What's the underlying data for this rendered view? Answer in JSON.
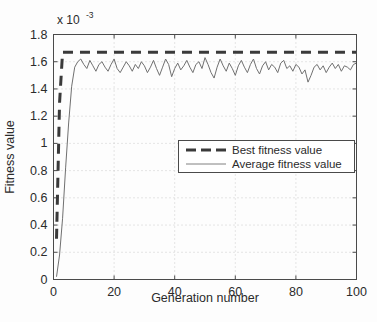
{
  "chart_data": {
    "type": "line",
    "title": "",
    "xlabel": "Generation number",
    "ylabel": "Fitness value",
    "y_exponent_label": "x 10",
    "y_exponent_power": "-3",
    "xlim": [
      0,
      100
    ],
    "ylim": [
      0,
      1.8
    ],
    "xticks": [
      0,
      20,
      40,
      60,
      80,
      100
    ],
    "yticks": [
      0,
      0.2,
      0.4,
      0.6,
      0.8,
      1,
      1.2,
      1.4,
      1.6,
      1.8
    ],
    "xtick_labels": [
      "0",
      "20",
      "40",
      "60",
      "80",
      "100"
    ],
    "ytick_labels": [
      "0",
      "0.2",
      "0.4",
      "0.6",
      "0.8",
      "1",
      "1.2",
      "1.4",
      "1.6",
      "1.8"
    ],
    "grid": "dotted",
    "legend_position": "center-right",
    "y_scale_note": "values are in units of 1e-3",
    "series": [
      {
        "name": "Best fitness value",
        "style": "dashed",
        "color": "#3a3a3a",
        "linewidth": 3,
        "x": [
          1,
          2,
          3,
          4,
          5,
          6,
          7,
          8,
          9,
          10,
          11,
          12,
          13,
          14,
          15,
          16,
          17,
          18,
          19,
          20,
          21,
          22,
          23,
          24,
          25,
          26,
          27,
          28,
          29,
          30,
          31,
          32,
          33,
          34,
          35,
          36,
          37,
          38,
          39,
          40,
          41,
          42,
          43,
          44,
          45,
          46,
          47,
          48,
          49,
          50,
          51,
          52,
          53,
          54,
          55,
          56,
          57,
          58,
          59,
          60,
          61,
          62,
          63,
          64,
          65,
          66,
          67,
          68,
          69,
          70,
          71,
          72,
          73,
          74,
          75,
          76,
          77,
          78,
          79,
          80,
          81,
          82,
          83,
          84,
          85,
          86,
          87,
          88,
          89,
          90,
          91,
          92,
          93,
          94,
          95,
          96,
          97,
          98,
          99,
          100
        ],
        "values": [
          0.3,
          1.3,
          1.67,
          1.67,
          1.67,
          1.67,
          1.67,
          1.67,
          1.67,
          1.67,
          1.67,
          1.67,
          1.67,
          1.67,
          1.67,
          1.67,
          1.67,
          1.67,
          1.67,
          1.67,
          1.67,
          1.67,
          1.67,
          1.67,
          1.67,
          1.67,
          1.67,
          1.67,
          1.67,
          1.67,
          1.67,
          1.67,
          1.67,
          1.67,
          1.67,
          1.67,
          1.67,
          1.67,
          1.67,
          1.67,
          1.67,
          1.67,
          1.67,
          1.67,
          1.67,
          1.67,
          1.67,
          1.67,
          1.67,
          1.67,
          1.67,
          1.67,
          1.67,
          1.67,
          1.67,
          1.67,
          1.67,
          1.67,
          1.67,
          1.67,
          1.67,
          1.67,
          1.67,
          1.67,
          1.67,
          1.67,
          1.67,
          1.67,
          1.67,
          1.67,
          1.67,
          1.67,
          1.67,
          1.67,
          1.67,
          1.67,
          1.67,
          1.67,
          1.67,
          1.67,
          1.67,
          1.67,
          1.67,
          1.67,
          1.67,
          1.67,
          1.67,
          1.67,
          1.67,
          1.67,
          1.67,
          1.67,
          1.67,
          1.67,
          1.67,
          1.67,
          1.67,
          1.67,
          1.67,
          1.67
        ]
      },
      {
        "name": "Average fitness value",
        "style": "solid",
        "color": "#707070",
        "linewidth": 1,
        "x": [
          1,
          2,
          3,
          4,
          5,
          6,
          7,
          8,
          9,
          10,
          11,
          12,
          13,
          14,
          15,
          16,
          17,
          18,
          19,
          20,
          21,
          22,
          23,
          24,
          25,
          26,
          27,
          28,
          29,
          30,
          31,
          32,
          33,
          34,
          35,
          36,
          37,
          38,
          39,
          40,
          41,
          42,
          43,
          44,
          45,
          46,
          47,
          48,
          49,
          50,
          51,
          52,
          53,
          54,
          55,
          56,
          57,
          58,
          59,
          60,
          61,
          62,
          63,
          64,
          65,
          66,
          67,
          68,
          69,
          70,
          71,
          72,
          73,
          74,
          75,
          76,
          77,
          78,
          79,
          80,
          81,
          82,
          83,
          84,
          85,
          86,
          87,
          88,
          89,
          90,
          91,
          92,
          93,
          94,
          95,
          96,
          97,
          98,
          99,
          100
        ],
        "values": [
          0.02,
          0.18,
          0.45,
          0.82,
          1.15,
          1.42,
          1.56,
          1.6,
          1.62,
          1.58,
          1.55,
          1.61,
          1.57,
          1.53,
          1.58,
          1.6,
          1.56,
          1.53,
          1.58,
          1.62,
          1.55,
          1.52,
          1.56,
          1.6,
          1.57,
          1.53,
          1.58,
          1.55,
          1.6,
          1.57,
          1.52,
          1.56,
          1.61,
          1.55,
          1.5,
          1.56,
          1.62,
          1.58,
          1.49,
          1.55,
          1.59,
          1.54,
          1.57,
          1.61,
          1.56,
          1.52,
          1.58,
          1.6,
          1.55,
          1.63,
          1.58,
          1.52,
          1.48,
          1.56,
          1.62,
          1.57,
          1.53,
          1.59,
          1.55,
          1.5,
          1.57,
          1.61,
          1.56,
          1.52,
          1.58,
          1.62,
          1.55,
          1.51,
          1.57,
          1.6,
          1.54,
          1.58,
          1.56,
          1.52,
          1.59,
          1.61,
          1.55,
          1.57,
          1.53,
          1.58,
          1.56,
          1.51,
          1.54,
          1.45,
          1.5,
          1.56,
          1.58,
          1.54,
          1.57,
          1.52,
          1.56,
          1.59,
          1.55,
          1.58,
          1.53,
          1.57,
          1.56,
          1.54,
          1.58,
          1.59
        ]
      }
    ]
  },
  "legend": {
    "items": [
      {
        "label": "Best fitness value",
        "marker": "dashed-line"
      },
      {
        "label": "Average fitness value",
        "marker": "solid-line"
      }
    ]
  }
}
